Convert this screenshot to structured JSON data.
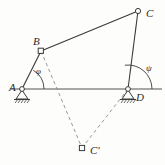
{
  "figure": {
    "type": "four-bar-linkage-diagram",
    "width": 165,
    "height": 165,
    "background_color": "#fdfdfc",
    "stroke_color": "#3a3a3a",
    "ground_line_color": "#8a8a8a",
    "dashed_color": "#8f8f8f"
  },
  "points": [
    {
      "id": "A",
      "label": "A",
      "x": 22,
      "y": 89,
      "joint": "fixed-pivot",
      "label_x": 9,
      "label_y": 82
    },
    {
      "id": "B",
      "label": "B",
      "x": 41,
      "y": 51,
      "joint": "square-pin",
      "label_x": 33,
      "label_y": 36
    },
    {
      "id": "C",
      "label": "C",
      "x": 138,
      "y": 11,
      "joint": "circle-pin",
      "label_x": 146,
      "label_y": 8
    },
    {
      "id": "D",
      "label": "D",
      "x": 128,
      "y": 89,
      "joint": "fixed-pivot",
      "label_x": 136,
      "label_y": 92
    },
    {
      "id": "Cp",
      "label": "C'",
      "x": 82,
      "y": 148,
      "joint": "square-pin",
      "label_x": 90,
      "label_y": 145
    }
  ],
  "links": [
    {
      "id": "AB",
      "from": "A",
      "to": "B",
      "style": "solid"
    },
    {
      "id": "BC",
      "from": "B",
      "to": "C",
      "style": "solid"
    },
    {
      "id": "CD",
      "from": "C",
      "to": "D",
      "style": "solid"
    },
    {
      "id": "BCp",
      "from": "B",
      "to": "Cp",
      "style": "dashed"
    },
    {
      "id": "DCp",
      "from": "D",
      "to": "Cp",
      "style": "dashed"
    }
  ],
  "ground_line": {
    "x1": 10,
    "y1": 89,
    "x2": 162,
    "y2": 89
  },
  "angles": [
    {
      "id": "phi",
      "label": "φ",
      "at": "A",
      "label_x": 36,
      "label_y": 67,
      "radius": 22
    },
    {
      "id": "psi",
      "label": "ψ",
      "at": "D",
      "label_x": 146,
      "label_y": 64,
      "radius": 24
    }
  ]
}
